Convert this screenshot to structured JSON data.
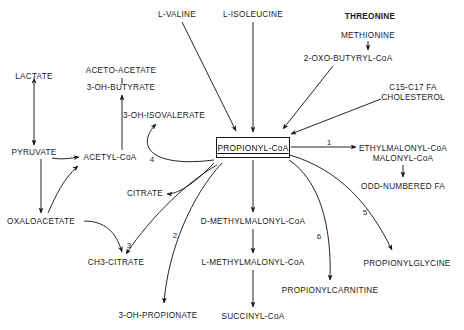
{
  "diagram": {
    "stroke_color": "#1a1a1a",
    "background_color": "#ffffff",
    "central": {
      "label": "PROPIONYL-CoA",
      "boxed": true,
      "underlined": true
    },
    "nodes": [
      {
        "id": "l-valine",
        "label": "L-VALINE",
        "x": 177,
        "y": 14,
        "bold": false
      },
      {
        "id": "l-isoleucine",
        "label": "L-ISOLEUCINE",
        "x": 253,
        "y": 14,
        "bold": false
      },
      {
        "id": "threonine",
        "label": "THREONINE",
        "x": 370,
        "y": 16,
        "bold": true
      },
      {
        "id": "methionine",
        "label": "METHIONINE",
        "x": 368,
        "y": 35,
        "bold": false
      },
      {
        "id": "2-oxo-butyryl-coa",
        "label": "2-OXO-BUTYRYL-CoA",
        "x": 348,
        "y": 58,
        "bold": false
      },
      {
        "id": "c15-c17-fa",
        "label": "C15-C17 FA",
        "x": 413,
        "y": 87,
        "bold": false
      },
      {
        "id": "cholesterol",
        "label": "CHOLESTEROL",
        "x": 413,
        "y": 97,
        "bold": false
      },
      {
        "id": "lactate",
        "label": "LACTATE",
        "x": 34,
        "y": 76,
        "bold": false
      },
      {
        "id": "aceto-acetate",
        "label": "ACETO-ACETATE",
        "x": 121,
        "y": 70,
        "bold": false
      },
      {
        "id": "3-oh-butyrate",
        "label": "3-OH-BUTYRATE",
        "x": 121,
        "y": 87,
        "bold": false
      },
      {
        "id": "3-oh-isovalerate",
        "label": "3-OH-ISOVALERATE",
        "x": 164,
        "y": 115,
        "bold": false
      },
      {
        "id": "pyruvate",
        "label": "PYRUVATE",
        "x": 34,
        "y": 152,
        "bold": false
      },
      {
        "id": "acetyl-coa",
        "label": "ACETYL-CoA",
        "x": 110,
        "y": 157,
        "bold": false
      },
      {
        "id": "citrate",
        "label": "CITRATE",
        "x": 145,
        "y": 193,
        "bold": false
      },
      {
        "id": "oxaloacetate",
        "label": "OXALOACETATE",
        "x": 41,
        "y": 221,
        "bold": false
      },
      {
        "id": "ch3-citrate",
        "label": "CH3-CITRATE",
        "x": 116,
        "y": 262,
        "bold": false
      },
      {
        "id": "3-oh-propionate",
        "label": "3-OH-PROPIONATE",
        "x": 158,
        "y": 315,
        "bold": false
      },
      {
        "id": "d-methylmalonyl-coa",
        "label": "D-METHYLMALONYL-CoA",
        "x": 253,
        "y": 221,
        "bold": false
      },
      {
        "id": "l-methylmalonyl-coa",
        "label": "L-METHYLMALONYL-CoA",
        "x": 253,
        "y": 262,
        "bold": false
      },
      {
        "id": "succinyl-coa",
        "label": "SUCCINYL-CoA",
        "x": 253,
        "y": 316,
        "bold": false
      },
      {
        "id": "propionylcarnitine",
        "label": "PROPIONYLCARNITINE",
        "x": 330,
        "y": 290,
        "bold": false
      },
      {
        "id": "ethylmalonyl-coa",
        "label": "ETHYLMALONYL-CoA",
        "x": 403,
        "y": 148,
        "bold": false
      },
      {
        "id": "malonyl-coa",
        "label": "MALONYL-CoA",
        "x": 403,
        "y": 158,
        "bold": false
      },
      {
        "id": "odd-numbered-fa",
        "label": "ODD-NUMBERED FA",
        "x": 403,
        "y": 186,
        "bold": false
      },
      {
        "id": "propionylglycine",
        "label": "PROPIONYLGLYCINE",
        "x": 407,
        "y": 263,
        "bold": false
      }
    ],
    "enzyme_labels": [
      {
        "id": "enzyme-1",
        "label": "1",
        "x": 329,
        "y": 142
      },
      {
        "id": "enzyme-2",
        "label": "2",
        "x": 175,
        "y": 235
      },
      {
        "id": "enzyme-3",
        "label": "3",
        "x": 129,
        "y": 245
      },
      {
        "id": "enzyme-4",
        "label": "4",
        "x": 152,
        "y": 159
      },
      {
        "id": "enzyme-5",
        "label": "5",
        "x": 365,
        "y": 212
      },
      {
        "id": "enzyme-6",
        "label": "6",
        "x": 319,
        "y": 236
      }
    ],
    "edges": [
      {
        "id": "edge-valine-to-propionyl",
        "from": "l-valine",
        "to": "central"
      },
      {
        "id": "edge-isoleucine-to-propionyl",
        "from": "l-isoleucine",
        "to": "central"
      },
      {
        "id": "edge-methionine-to-oxobutyryl",
        "from": "methionine",
        "to": "2-oxo-butyryl-coa"
      },
      {
        "id": "edge-oxobutyryl-to-propionyl",
        "from": "2-oxo-butyryl-coa",
        "to": "central"
      },
      {
        "id": "edge-fa-chol-to-propionyl",
        "from": "c15-c17-fa",
        "to": "central"
      },
      {
        "id": "edge-lactate-pyruvate",
        "from": "lactate",
        "to": "pyruvate",
        "bidirectional": true
      },
      {
        "id": "edge-acetylcoa-to-3ohbutyrate",
        "from": "acetyl-coa",
        "to": "3-oh-butyrate"
      },
      {
        "id": "edge-3ohbutyrate-to-acetoacetate",
        "from": "3-oh-butyrate",
        "to": "aceto-acetate"
      },
      {
        "id": "edge-4-to-3ohisovalerate",
        "from": "central",
        "to": "3-oh-isovalerate"
      },
      {
        "id": "edge-pyruvate-to-acetylcoa",
        "from": "pyruvate",
        "to": "acetyl-coa"
      },
      {
        "id": "edge-pyruvate-to-oxaloacetate",
        "from": "pyruvate",
        "to": "oxaloacetate"
      },
      {
        "id": "edge-oxaloacetate-to-acetylcoa",
        "from": "oxaloacetate",
        "to": "acetyl-coa"
      },
      {
        "id": "edge-4-to-citrate",
        "from": "central",
        "to": "citrate"
      },
      {
        "id": "edge-3-to-ch3citrate",
        "from": "oxaloacetate",
        "to": "ch3-citrate"
      },
      {
        "id": "edge-2-to-3ohpropionate",
        "from": "central",
        "to": "3-oh-propionate"
      },
      {
        "id": "edge-propionyl-to-dmethyl",
        "from": "central",
        "to": "d-methylmalonyl-coa"
      },
      {
        "id": "edge-dmethyl-to-lmethyl",
        "from": "d-methylmalonyl-coa",
        "to": "l-methylmalonyl-coa"
      },
      {
        "id": "edge-lmethyl-to-succinyl",
        "from": "l-methylmalonyl-coa",
        "to": "succinyl-coa"
      },
      {
        "id": "edge-6-to-carnitine",
        "from": "central",
        "to": "propionylcarnitine"
      },
      {
        "id": "edge-1-to-ethylmalonyl",
        "from": "central",
        "to": "ethylmalonyl-coa"
      },
      {
        "id": "edge-malonyl-to-oddfa",
        "from": "malonyl-coa",
        "to": "odd-numbered-fa"
      },
      {
        "id": "edge-5-to-propionylglycine",
        "from": "central",
        "to": "propionylglycine"
      }
    ]
  }
}
